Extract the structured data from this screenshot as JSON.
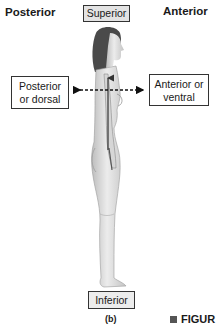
{
  "labels": {
    "posterior_heading": "Posterior",
    "anterior_heading": "Anterior",
    "superior": "Superior",
    "inferior": "Inferior",
    "posterior_box_line1": "Posterior",
    "posterior_box_line2": "or dorsal",
    "anterior_box_line1": "Anterior or",
    "anterior_box_line2": "ventral",
    "panel_caption": "(b)",
    "figure_caption": "FIGUR"
  },
  "colors": {
    "text": "#1a1a1a",
    "box_border": "#333333",
    "superior_box_fill": "#e3e3e3",
    "arrow": "#111111",
    "body_shading": "#d8d8d8"
  }
}
